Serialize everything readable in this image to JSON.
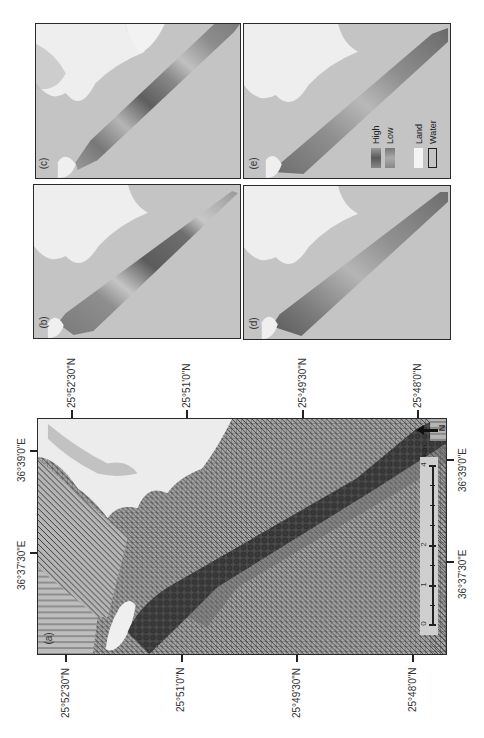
{
  "figure": {
    "panels": {
      "a": {
        "label": "(a)"
      },
      "b": {
        "label": "(b)"
      },
      "c": {
        "label": "(c)"
      },
      "d": {
        "label": "(d)"
      },
      "e": {
        "label": "(e)"
      }
    },
    "latitude_ticks": [
      "25°52'30\"N",
      "25°51'0\"N",
      "25°49'30\"N",
      "25°48'0\"N"
    ],
    "longitude_ticks": [
      "36°39'0\"E",
      "36°37'30\"E"
    ],
    "scale_bar": {
      "labels": [
        "0",
        "1",
        "2",
        "4"
      ],
      "unit": "Km"
    },
    "north_arrow": {
      "label": "N"
    },
    "legend": {
      "gradient_high": "High",
      "gradient_low": "Low",
      "land": "Land",
      "water": "Water"
    },
    "colors": {
      "water": "#c4c4c4",
      "land": "#f0f0f0",
      "band_dark": "#555555",
      "hatch": "#3a3a3a"
    }
  }
}
